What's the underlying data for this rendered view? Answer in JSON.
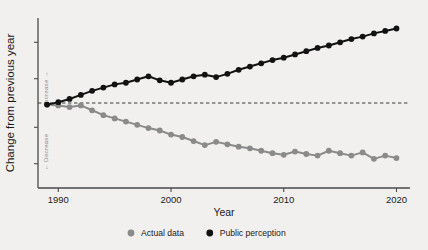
{
  "chart_data": {
    "type": "line",
    "title": "",
    "xlabel": "Year",
    "ylabel": "Change from previous year",
    "axis_annotations": {
      "positive_direction": "Increase →",
      "negative_direction": "← Decrease"
    },
    "xlim": [
      1988.2,
      2021.2
    ],
    "ylim": [
      -10.5,
      10.5
    ],
    "xticks": [
      1990,
      2000,
      2010,
      2020
    ],
    "xticklabels": [
      "1990",
      "2000",
      "2010",
      "2020"
    ],
    "yticks": [],
    "yticklabels": [],
    "grid": false,
    "zero_reference_line": {
      "value": 0,
      "style": "dashed",
      "color": "#3a3a3a"
    },
    "legend": {
      "position": "bottom-center",
      "entries": [
        {
          "name": "Actual data",
          "color": "#8a8a8a",
          "marker": "circle"
        },
        {
          "name": "Public perception",
          "color": "#121212",
          "marker": "circle"
        }
      ]
    },
    "x": [
      1989,
      1990,
      1991,
      1992,
      1993,
      1994,
      1995,
      1996,
      1997,
      1998,
      1999,
      2000,
      2001,
      2002,
      2003,
      2004,
      2005,
      2006,
      2007,
      2008,
      2009,
      2010,
      2011,
      2012,
      2013,
      2014,
      2015,
      2016,
      2017,
      2018,
      2019,
      2020
    ],
    "series": [
      {
        "name": "Actual data",
        "color": "#8a8a8a",
        "marker": "circle",
        "values": [
          -0.2,
          -0.3,
          -0.5,
          -0.3,
          -0.9,
          -1.5,
          -1.9,
          -2.3,
          -2.7,
          -3.1,
          -3.4,
          -3.9,
          -4.2,
          -4.7,
          -5.2,
          -4.8,
          -5.1,
          -5.4,
          -5.6,
          -5.9,
          -6.2,
          -6.4,
          -6.0,
          -6.3,
          -6.5,
          -5.9,
          -6.2,
          -6.5,
          -6.1,
          -6.9,
          -6.5,
          -6.8
        ]
      },
      {
        "name": "Public perception",
        "color": "#121212",
        "marker": "circle",
        "values": [
          -0.2,
          0.1,
          0.5,
          1.0,
          1.5,
          1.9,
          2.3,
          2.5,
          2.9,
          3.3,
          2.8,
          2.5,
          2.9,
          3.3,
          3.5,
          3.2,
          3.6,
          4.1,
          4.5,
          4.9,
          5.3,
          5.6,
          6.0,
          6.4,
          6.8,
          7.1,
          7.5,
          7.9,
          8.2,
          8.6,
          8.9,
          9.2
        ]
      }
    ]
  },
  "figure": {
    "background_color": "#f1f0ef",
    "axis_color": "#4a4a4a"
  }
}
